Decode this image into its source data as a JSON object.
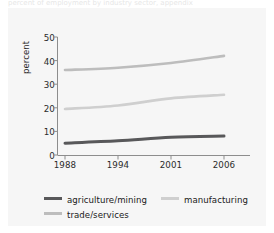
{
  "figure": {
    "caption_sliver": "percent of employment by industry sector, appendix",
    "background": "#ffffff",
    "panel_color": "#f6f6f6"
  },
  "axes": {
    "ylabel": "percent",
    "yticks": [
      "0",
      "10",
      "20",
      "30",
      "40",
      "50"
    ],
    "xticks": [
      "1988",
      "1994",
      "2001",
      "2006"
    ]
  },
  "legend": {
    "items": [
      {
        "label": "agriculture/mining",
        "color": "#58585a"
      },
      {
        "label": "manufacturing",
        "color": "#cfcfcf"
      },
      {
        "label": "trade/services",
        "color": "#bdbdbd"
      }
    ]
  },
  "chart_data": {
    "type": "line",
    "title": "",
    "xlabel": "",
    "ylabel": "percent",
    "categories": [
      "1988",
      "1994",
      "2001",
      "2006"
    ],
    "x": [
      1988,
      1994,
      2001,
      2006
    ],
    "ylim": [
      0,
      50
    ],
    "yticks": [
      0,
      10,
      20,
      30,
      40,
      50
    ],
    "grid": false,
    "legend_position": "bottom",
    "series": [
      {
        "name": "trade/services",
        "color": "#bdbdbd",
        "values": [
          36,
          37,
          39,
          42
        ]
      },
      {
        "name": "manufacturing",
        "color": "#cfcfcf",
        "values": [
          19.5,
          21,
          24,
          25.5
        ]
      },
      {
        "name": "agriculture/mining",
        "color": "#58585a",
        "values": [
          5,
          6,
          7.5,
          8
        ]
      }
    ]
  }
}
